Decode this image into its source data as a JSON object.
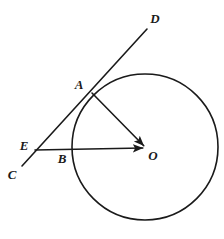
{
  "figure": {
    "type": "geometry-diagram",
    "background_color": "#ffffff",
    "stroke_color": "#1a1a1a",
    "canvas": {
      "width": 224,
      "height": 239
    }
  },
  "circle": {
    "name": "circle-O",
    "center_x": 145,
    "center_y": 147,
    "radius": 73,
    "stroke_color": "#1a1a1a",
    "stroke_width": 1.6,
    "fill": "none"
  },
  "points": {
    "A": {
      "label": "A",
      "x": 92,
      "y": 93,
      "label_x": 79,
      "label_y": 84
    },
    "B": {
      "label": "B",
      "x": 71,
      "y": 149,
      "label_x": 62,
      "label_y": 158
    },
    "C": {
      "label": "C",
      "x": 22,
      "y": 166,
      "label_x": 12,
      "label_y": 174
    },
    "D": {
      "label": "D",
      "x": 147,
      "y": 29,
      "label_x": 155,
      "label_y": 18
    },
    "E": {
      "label": "E",
      "x": 35,
      "y": 150,
      "label_x": 24,
      "label_y": 145
    },
    "O": {
      "label": "O",
      "x": 146,
      "y": 148,
      "label_x": 153,
      "label_y": 155
    }
  },
  "segments": [
    {
      "name": "line-CD",
      "from": "C",
      "to": "D",
      "x1": 22,
      "y1": 166,
      "x2": 147,
      "y2": 29,
      "arrow_start": false,
      "arrow_end": false,
      "stroke_width": 1.6
    },
    {
      "name": "segment-EO",
      "from": "E",
      "to": "O",
      "x1": 35,
      "y1": 150,
      "x2": 146,
      "y2": 148,
      "arrow_start": false,
      "arrow_end": true,
      "stroke_width": 1.6
    },
    {
      "name": "radius-AO",
      "from": "A",
      "to": "O",
      "x1": 92,
      "y1": 93,
      "x2": 146,
      "y2": 148,
      "arrow_start": false,
      "arrow_end": true,
      "stroke_width": 1.6
    }
  ],
  "labels": {
    "A": "A",
    "B": "B",
    "C": "C",
    "D": "D",
    "E": "E",
    "O": "O"
  }
}
